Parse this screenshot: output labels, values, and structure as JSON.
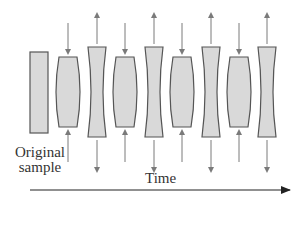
{
  "diagram": {
    "original_label_line1": "Original",
    "original_label_line2": "sample",
    "time_label": "Time",
    "colors": {
      "fill": "#d9d9d9",
      "stroke": "#555555",
      "arrow": "#7a7a7a",
      "axis": "#222222"
    },
    "original_sample": {
      "x": 30,
      "y": 52,
      "w": 18,
      "h": 81
    },
    "samples": [
      {
        "state": "compressed",
        "cx": 68,
        "arrows": "inward"
      },
      {
        "state": "stretched",
        "cx": 97,
        "arrows": "outward"
      },
      {
        "state": "compressed",
        "cx": 125,
        "arrows": "inward"
      },
      {
        "state": "stretched",
        "cx": 154,
        "arrows": "outward"
      },
      {
        "state": "compressed",
        "cx": 182,
        "arrows": "inward"
      },
      {
        "state": "stretched",
        "cx": 211,
        "arrows": "outward"
      },
      {
        "state": "compressed",
        "cx": 239,
        "arrows": "inward"
      },
      {
        "state": "stretched",
        "cx": 267,
        "arrows": "outward"
      }
    ]
  }
}
